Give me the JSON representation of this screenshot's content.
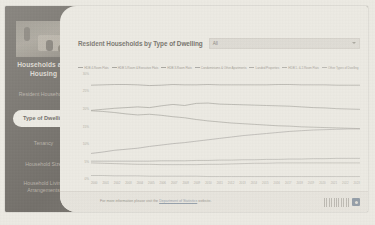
{
  "sidebar": {
    "photo_alt": "households-and-housing-photo",
    "title": "Households and Housing",
    "items": [
      {
        "label": "Resident Households",
        "active": false
      },
      {
        "label": "Type of Dwelling",
        "active": true
      },
      {
        "label": "Tenancy",
        "active": false
      },
      {
        "label": "Household Size",
        "active": false
      },
      {
        "label": "Household Living Arrangements",
        "active": false
      }
    ]
  },
  "header": {
    "chart_title": "Resident Households by Type of Dwelling",
    "filter_value": "All",
    "filter_icon": "chevron-down-icon"
  },
  "footnote": "Note: Data for 2005 and 2015 are estimated.",
  "footer": {
    "text_before": "For more information please visit the ",
    "link_text": "Department of Statistics",
    "text_after": " website.",
    "logo_label": "singapore-department-of-statistics-logo"
  },
  "chart_data": {
    "type": "line",
    "title": "Resident Households by Type of Dwelling",
    "xlabel": "",
    "ylabel": "",
    "ylim": [
      0,
      30
    ],
    "yticks": [
      "0%",
      "5%",
      "10%",
      "15%",
      "20%",
      "25%",
      "30%"
    ],
    "grid": false,
    "legend_position": "top",
    "x": [
      "2000",
      "2001",
      "2002",
      "2003",
      "2004",
      "2005",
      "2006",
      "2007",
      "2008",
      "2009",
      "2010",
      "2011",
      "2012",
      "2013",
      "2014",
      "2015",
      "2016",
      "2017",
      "2018",
      "2019",
      "2020",
      "2021",
      "2022",
      "2023"
    ],
    "series": [
      {
        "name": "HDB 4-Room Flats",
        "color": "#8c8a84",
        "values": [
          26.8,
          26.9,
          27.0,
          27.0,
          26.9,
          26.7,
          26.8,
          27.0,
          26.9,
          26.9,
          27.0,
          26.9,
          26.9,
          26.9,
          26.9,
          26.9,
          27.0,
          27.0,
          26.9,
          26.9,
          26.9,
          26.8,
          26.8,
          26.8
        ]
      },
      {
        "name": "HDB 5-Room & Executive Flats",
        "color": "#8e8c85",
        "values": [
          19.6,
          19.9,
          20.2,
          20.4,
          20.6,
          20.4,
          20.9,
          21.3,
          21.0,
          21.6,
          21.7,
          21.4,
          21.3,
          21.2,
          21.1,
          21.0,
          20.9,
          20.8,
          20.6,
          20.4,
          20.3,
          20.1,
          20.0,
          19.9
        ]
      },
      {
        "name": "HDB 3-Room Flats",
        "color": "#918f88",
        "values": [
          19.5,
          19.3,
          19.0,
          18.6,
          18.3,
          18.5,
          18.2,
          17.8,
          17.5,
          17.0,
          16.6,
          16.3,
          16.0,
          15.8,
          15.6,
          15.4,
          15.2,
          15.1,
          14.9,
          14.8,
          14.7,
          14.6,
          14.5,
          14.4
        ]
      },
      {
        "name": "Condominiums & Other Apartments",
        "color": "#969490",
        "values": [
          7.3,
          7.7,
          8.2,
          8.5,
          8.8,
          9.3,
          9.7,
          10.1,
          10.4,
          10.8,
          11.2,
          11.6,
          12.0,
          12.4,
          12.7,
          13.0,
          13.3,
          13.6,
          13.8,
          14.0,
          14.1,
          14.2,
          14.3,
          14.3
        ]
      },
      {
        "name": "Landed Properties",
        "color": "#9b9993",
        "values": [
          5.1,
          5.1,
          5.1,
          5.1,
          5.1,
          5.1,
          5.2,
          5.2,
          5.2,
          5.3,
          5.3,
          5.4,
          5.4,
          5.5,
          5.5,
          5.6,
          5.6,
          5.7,
          5.7,
          5.8,
          5.8,
          5.9,
          5.9,
          5.9
        ]
      },
      {
        "name": "HDB 1- & 2-Room Flats",
        "color": "#a09e98",
        "values": [
          4.6,
          4.5,
          4.4,
          4.3,
          4.2,
          4.2,
          4.1,
          4.1,
          4.1,
          4.1,
          4.2,
          4.2,
          4.3,
          4.4,
          4.5,
          4.5,
          4.6,
          4.6,
          4.6,
          4.6,
          4.6,
          4.6,
          4.6,
          4.6
        ]
      },
      {
        "name": "Other Types of Dwelling",
        "color": "#a5a39d",
        "values": [
          1.0,
          1.0,
          0.9,
          0.9,
          0.9,
          0.8,
          0.8,
          0.8,
          0.8,
          0.8,
          0.7,
          0.7,
          0.7,
          0.7,
          0.7,
          0.7,
          0.7,
          0.7,
          0.7,
          0.7,
          0.7,
          0.7,
          0.7,
          0.7
        ]
      }
    ]
  }
}
